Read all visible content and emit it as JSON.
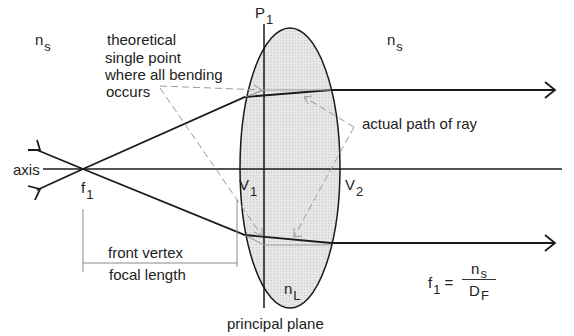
{
  "diagram": {
    "type": "thin-lens ray diagram",
    "labels": {
      "ns_left": {
        "base": "n",
        "sub": "s"
      },
      "ns_right": {
        "base": "n",
        "sub": "s"
      },
      "p1": {
        "base": "P",
        "sub": "1"
      },
      "theoretical_line1": "theoretical",
      "theoretical_line2": "single point",
      "theoretical_line3": "where all bending",
      "theoretical_line4": "occurs",
      "actual_path": "actual path of ray",
      "axis": "axis",
      "f1": {
        "base": "f",
        "sub": "1"
      },
      "v1": {
        "base": "V",
        "sub": "1"
      },
      "v2": {
        "base": "V",
        "sub": "2"
      },
      "front_vertex": "front vertex",
      "focal_length": "focal length",
      "nL": {
        "base": "n",
        "sub": "L"
      },
      "principal_plane": "principal plane"
    },
    "formula": {
      "lhs_base": "f",
      "lhs_sub": "1",
      "equals": "=",
      "num_base": "n",
      "num_sub": "s",
      "den_base": "D",
      "den_sub": "F"
    },
    "colors": {
      "line": "#1a1a1a",
      "dashed": "#9a9a9a",
      "lens_fill": "#e2e2e2",
      "dim_line": "#8a8a8a"
    }
  }
}
